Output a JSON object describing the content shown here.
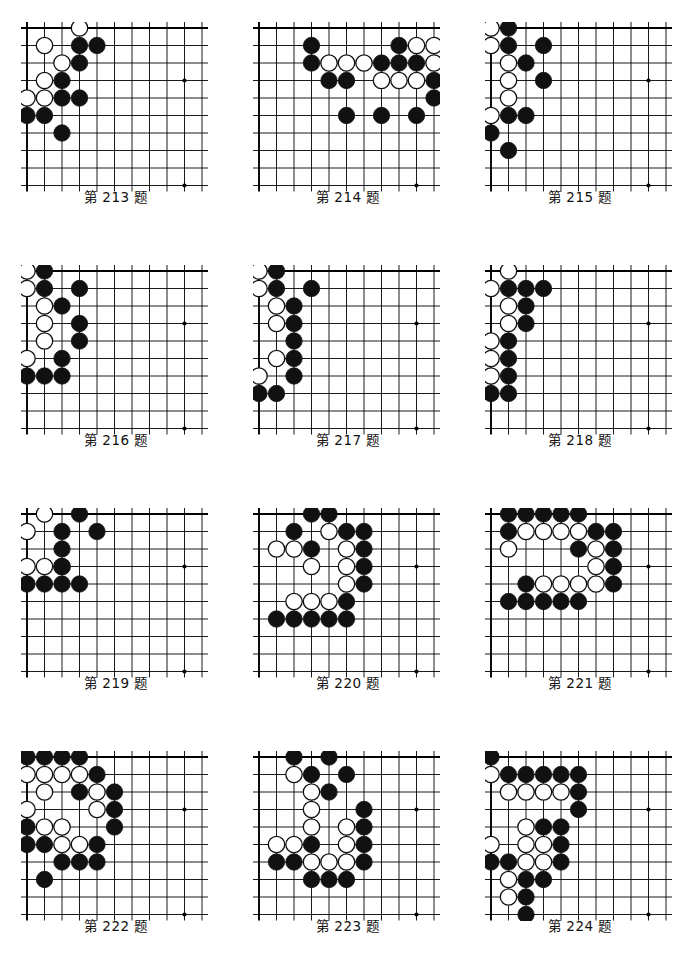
{
  "page": {
    "type": "go-problem-collection",
    "columns": 3,
    "rows": 4,
    "caption_prefix": "第",
    "caption_suffix": "题"
  },
  "board_style": {
    "cols": 11,
    "rows": 10,
    "spacing": 17.5,
    "stone_radius": 8.2,
    "line_color": "#000000",
    "black_stone_color": "#111111",
    "white_stone_color": "#ffffff",
    "white_stone_border": "#111111",
    "star_point_color": "#000000",
    "edge_line_width": 1.9,
    "inner_line_width": 0.9,
    "star_points": [
      [
        9,
        3
      ],
      [
        9,
        9
      ]
    ]
  },
  "problems": [
    {
      "number": "213",
      "caption": "第 213 题",
      "black": [
        [
          3,
          1
        ],
        [
          4,
          1
        ],
        [
          3,
          2
        ],
        [
          2,
          3
        ],
        [
          2,
          4
        ],
        [
          3,
          4
        ],
        [
          0,
          5
        ],
        [
          1,
          5
        ],
        [
          2,
          6
        ]
      ],
      "white": [
        [
          3,
          0
        ],
        [
          1,
          1
        ],
        [
          2,
          2
        ],
        [
          1,
          3
        ],
        [
          0,
          4
        ],
        [
          1,
          4
        ]
      ]
    },
    {
      "number": "214",
      "caption": "第 214 题",
      "black": [
        [
          0,
          1
        ],
        [
          5,
          1
        ],
        [
          8,
          1
        ],
        [
          10,
          1
        ],
        [
          0,
          2
        ],
        [
          4,
          2
        ],
        [
          5,
          2
        ],
        [
          6,
          2
        ],
        [
          8,
          2
        ],
        [
          9,
          2
        ],
        [
          10,
          2
        ],
        [
          1,
          3
        ],
        [
          2,
          3
        ],
        [
          7,
          3
        ],
        [
          7,
          4
        ],
        [
          2,
          5
        ],
        [
          4,
          5
        ],
        [
          6,
          5
        ]
      ],
      "white": [
        [
          6,
          1
        ],
        [
          7,
          1
        ],
        [
          9,
          1
        ],
        [
          1,
          2
        ],
        [
          2,
          2
        ],
        [
          3,
          2
        ],
        [
          7,
          2
        ],
        [
          4,
          3
        ],
        [
          5,
          3
        ],
        [
          6,
          3
        ]
      ],
      "offset_x": 3
    },
    {
      "number": "215",
      "caption": "第 215 题",
      "black": [
        [
          1,
          0
        ],
        [
          1,
          1
        ],
        [
          3,
          1
        ],
        [
          2,
          2
        ],
        [
          3,
          3
        ],
        [
          1,
          5
        ],
        [
          2,
          5
        ],
        [
          0,
          6
        ],
        [
          1,
          7
        ]
      ],
      "white": [
        [
          0,
          0
        ],
        [
          0,
          1
        ],
        [
          1,
          2
        ],
        [
          1,
          3
        ],
        [
          1,
          4
        ],
        [
          0,
          5
        ]
      ]
    },
    {
      "number": "216",
      "caption": "第 216 题",
      "black": [
        [
          1,
          0
        ],
        [
          1,
          1
        ],
        [
          3,
          1
        ],
        [
          2,
          2
        ],
        [
          3,
          3
        ],
        [
          3,
          4
        ],
        [
          2,
          5
        ],
        [
          0,
          6
        ],
        [
          1,
          6
        ],
        [
          2,
          6
        ]
      ],
      "white": [
        [
          0,
          0
        ],
        [
          0,
          1
        ],
        [
          1,
          2
        ],
        [
          1,
          3
        ],
        [
          1,
          4
        ],
        [
          0,
          5
        ]
      ]
    },
    {
      "number": "217",
      "caption": "第 217 题",
      "black": [
        [
          1,
          0
        ],
        [
          1,
          1
        ],
        [
          3,
          1
        ],
        [
          2,
          2
        ],
        [
          2,
          3
        ],
        [
          2,
          4
        ],
        [
          2,
          5
        ],
        [
          2,
          6
        ],
        [
          0,
          7
        ],
        [
          1,
          7
        ]
      ],
      "white": [
        [
          0,
          0
        ],
        [
          0,
          1
        ],
        [
          1,
          2
        ],
        [
          1,
          3
        ],
        [
          1,
          5
        ],
        [
          0,
          6
        ]
      ]
    },
    {
      "number": "218",
      "caption": "第 218 题",
      "black": [
        [
          1,
          1
        ],
        [
          2,
          1
        ],
        [
          3,
          1
        ],
        [
          2,
          2
        ],
        [
          2,
          3
        ],
        [
          1,
          4
        ],
        [
          1,
          5
        ],
        [
          1,
          6
        ],
        [
          0,
          7
        ],
        [
          1,
          7
        ]
      ],
      "white": [
        [
          1,
          0
        ],
        [
          0,
          1
        ],
        [
          1,
          2
        ],
        [
          1,
          3
        ],
        [
          0,
          4
        ],
        [
          0,
          5
        ],
        [
          0,
          6
        ]
      ]
    },
    {
      "number": "219",
      "caption": "第 219 题",
      "black": [
        [
          3,
          0
        ],
        [
          2,
          1
        ],
        [
          4,
          1
        ],
        [
          2,
          2
        ],
        [
          2,
          3
        ],
        [
          0,
          4
        ],
        [
          1,
          4
        ],
        [
          2,
          4
        ],
        [
          3,
          4
        ]
      ],
      "white": [
        [
          1,
          0
        ],
        [
          0,
          1
        ],
        [
          0,
          3
        ],
        [
          1,
          3
        ],
        [
          2,
          3
        ]
      ]
    },
    {
      "number": "220",
      "caption": "第 220 题",
      "black": [
        [
          2,
          0
        ],
        [
          3,
          0
        ],
        [
          1,
          1
        ],
        [
          4,
          1
        ],
        [
          5,
          1
        ],
        [
          2,
          2
        ],
        [
          5,
          2
        ],
        [
          5,
          3
        ],
        [
          5,
          4
        ],
        [
          4,
          5
        ],
        [
          0,
          6
        ],
        [
          1,
          6
        ],
        [
          2,
          6
        ],
        [
          3,
          6
        ],
        [
          4,
          6
        ]
      ],
      "white": [
        [
          3,
          1
        ],
        [
          0,
          2
        ],
        [
          1,
          2
        ],
        [
          4,
          2
        ],
        [
          2,
          3
        ],
        [
          4,
          3
        ],
        [
          4,
          4
        ],
        [
          1,
          5
        ],
        [
          2,
          5
        ],
        [
          3,
          5
        ]
      ],
      "offset_x": 1
    },
    {
      "number": "221",
      "caption": "第 221 题",
      "black": [
        [
          0,
          0
        ],
        [
          1,
          0
        ],
        [
          2,
          0
        ],
        [
          3,
          0
        ],
        [
          4,
          0
        ],
        [
          0,
          1
        ],
        [
          5,
          1
        ],
        [
          6,
          1
        ],
        [
          4,
          2
        ],
        [
          6,
          2
        ],
        [
          6,
          3
        ],
        [
          1,
          4
        ],
        [
          6,
          4
        ],
        [
          0,
          5
        ],
        [
          1,
          5
        ],
        [
          2,
          5
        ],
        [
          3,
          5
        ],
        [
          4,
          5
        ]
      ],
      "white": [
        [
          1,
          1
        ],
        [
          2,
          1
        ],
        [
          3,
          1
        ],
        [
          4,
          1
        ],
        [
          0,
          2
        ],
        [
          5,
          2
        ],
        [
          5,
          3
        ],
        [
          2,
          4
        ],
        [
          3,
          4
        ],
        [
          4,
          4
        ],
        [
          5,
          4
        ]
      ],
      "offset_x": 1
    },
    {
      "number": "222",
      "caption": "第 222 题",
      "black": [
        [
          0,
          0
        ],
        [
          1,
          0
        ],
        [
          2,
          0
        ],
        [
          3,
          0
        ],
        [
          4,
          1
        ],
        [
          3,
          2
        ],
        [
          5,
          2
        ],
        [
          5,
          3
        ],
        [
          0,
          4
        ],
        [
          5,
          4
        ],
        [
          0,
          5
        ],
        [
          1,
          5
        ],
        [
          4,
          5
        ],
        [
          2,
          6
        ],
        [
          3,
          6
        ],
        [
          4,
          6
        ],
        [
          1,
          7
        ]
      ],
      "white": [
        [
          0,
          1
        ],
        [
          1,
          1
        ],
        [
          2,
          1
        ],
        [
          3,
          1
        ],
        [
          1,
          2
        ],
        [
          4,
          2
        ],
        [
          0,
          3
        ],
        [
          4,
          3
        ],
        [
          1,
          4
        ],
        [
          2,
          4
        ],
        [
          2,
          5
        ],
        [
          3,
          5
        ]
      ],
      "offset_x": 0
    },
    {
      "number": "223",
      "caption": "第 223 题",
      "black": [
        [
          1,
          0
        ],
        [
          3,
          0
        ],
        [
          2,
          1
        ],
        [
          4,
          1
        ],
        [
          3,
          2
        ],
        [
          5,
          3
        ],
        [
          5,
          4
        ],
        [
          2,
          5
        ],
        [
          5,
          5
        ],
        [
          0,
          6
        ],
        [
          1,
          6
        ],
        [
          5,
          6
        ],
        [
          2,
          7
        ],
        [
          3,
          7
        ],
        [
          4,
          7
        ]
      ],
      "white": [
        [
          1,
          1
        ],
        [
          2,
          2
        ],
        [
          2,
          3
        ],
        [
          2,
          4
        ],
        [
          4,
          4
        ],
        [
          0,
          5
        ],
        [
          1,
          5
        ],
        [
          4,
          5
        ],
        [
          2,
          6
        ],
        [
          3,
          6
        ],
        [
          4,
          6
        ]
      ],
      "offset_x": 1
    },
    {
      "number": "224",
      "caption": "第 224 题",
      "black": [
        [
          0,
          0
        ],
        [
          1,
          1
        ],
        [
          2,
          1
        ],
        [
          3,
          1
        ],
        [
          4,
          1
        ],
        [
          5,
          1
        ],
        [
          5,
          2
        ],
        [
          5,
          3
        ],
        [
          3,
          4
        ],
        [
          4,
          4
        ],
        [
          4,
          5
        ],
        [
          0,
          6
        ],
        [
          1,
          6
        ],
        [
          4,
          6
        ],
        [
          2,
          7
        ],
        [
          3,
          7
        ],
        [
          2,
          8
        ],
        [
          2,
          9
        ]
      ],
      "white": [
        [
          0,
          1
        ],
        [
          1,
          2
        ],
        [
          2,
          2
        ],
        [
          3,
          2
        ],
        [
          4,
          2
        ],
        [
          2,
          4
        ],
        [
          0,
          5
        ],
        [
          2,
          5
        ],
        [
          3,
          5
        ],
        [
          2,
          6
        ],
        [
          3,
          6
        ],
        [
          1,
          7
        ],
        [
          1,
          8
        ]
      ],
      "offset_x": 0
    }
  ]
}
